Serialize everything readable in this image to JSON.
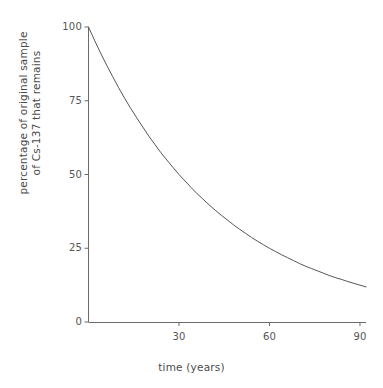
{
  "chart_data": {
    "type": "line",
    "title": "",
    "subtitle": "",
    "xlabel": "time (years)",
    "ylabel_line1": "percentage of original sample",
    "ylabel_line2": "of Cs-137 that remains",
    "xlim": [
      0,
      92
    ],
    "ylim": [
      0,
      100
    ],
    "grid": false,
    "legend": "none",
    "xticks": [
      {
        "value": 30,
        "label": "30"
      },
      {
        "value": 60,
        "label": "60"
      },
      {
        "value": 90,
        "label": "90"
      }
    ],
    "yticks": [
      {
        "value": 0,
        "label": "0"
      },
      {
        "value": 25,
        "label": "25"
      },
      {
        "value": 50,
        "label": "50"
      },
      {
        "value": 75,
        "label": "75"
      },
      {
        "value": 100,
        "label": "100"
      }
    ],
    "half_life_years": 30,
    "series": [
      {
        "name": "Cs-137 remaining",
        "color": "#555555",
        "x": [
          0,
          2,
          4,
          6,
          8,
          10,
          12,
          14,
          16,
          18,
          20,
          22,
          24,
          26,
          28,
          30,
          32,
          34,
          36,
          38,
          40,
          42,
          44,
          46,
          48,
          50,
          52,
          54,
          56,
          58,
          60,
          62,
          64,
          66,
          68,
          70,
          72,
          74,
          76,
          78,
          80,
          82,
          84,
          86,
          88,
          90,
          92
        ],
        "values": [
          100.0,
          95.5,
          91.2,
          87.1,
          83.2,
          79.4,
          75.8,
          72.4,
          69.2,
          66.1,
          63.0,
          60.2,
          57.4,
          54.9,
          52.4,
          50.0,
          47.8,
          45.6,
          43.5,
          41.6,
          39.7,
          37.9,
          36.2,
          34.6,
          33.0,
          31.5,
          30.1,
          28.7,
          27.4,
          26.2,
          25.0,
          23.9,
          22.8,
          21.8,
          20.8,
          19.8,
          18.9,
          18.1,
          17.3,
          16.5,
          15.7,
          15.0,
          14.4,
          13.7,
          13.1,
          12.5,
          11.9
        ]
      }
    ]
  },
  "axis_style": {
    "axis_color": "#6b6b6b",
    "curve_color": "#555555",
    "background": "#ffffff"
  }
}
